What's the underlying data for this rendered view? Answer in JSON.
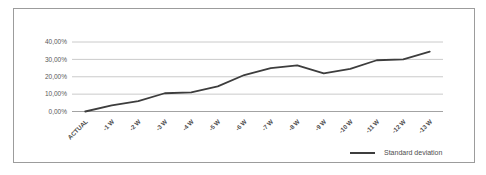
{
  "chart": {
    "legend": {
      "label": "Standard deviation"
    },
    "colors": {
      "line": "#3d3d3d",
      "grid": "#c4c4c4",
      "axis": "#999999",
      "text": "#595959",
      "xtick_text": "#4d4d4d",
      "frame": "#9c9c9c",
      "background": "#ffffff"
    }
  },
  "chart_data": {
    "type": "line",
    "title": "",
    "xlabel": "",
    "ylabel": "",
    "categories": [
      "ACTUAL",
      "-1 W",
      "-2 W",
      "-3 W",
      "-4 W",
      "-5 W",
      "-6 W",
      "-7 W",
      "-8 W",
      "-9 W",
      "-10 W",
      "-11 W",
      "-12 W",
      "-13 W"
    ],
    "series": [
      {
        "name": "Standard deviation",
        "values": [
          0,
          3.5,
          6,
          10.5,
          11,
          14.5,
          21,
          25,
          26.5,
          22,
          24.5,
          29.5,
          30,
          34.5
        ]
      }
    ],
    "ylim": [
      0,
      40
    ],
    "yticks": [
      0,
      10,
      20,
      30,
      40
    ],
    "ytick_labels": [
      "0,00%",
      "10,00%",
      "20,00%",
      "30,00%",
      "40,00%"
    ],
    "grid": true,
    "legend_position": "bottom-right",
    "xtick_rotation": 45
  }
}
